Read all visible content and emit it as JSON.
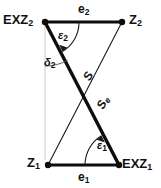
{
  "figure": {
    "type": "geometry-diagram",
    "background_color": "#ffffff",
    "stroke_color": "#111111"
  },
  "nodes": [
    {
      "id": "exz2",
      "label": "EXZ",
      "subscript": "2",
      "x": 45,
      "y": 22,
      "label_x": 3,
      "label_y": 13
    },
    {
      "id": "z2",
      "label": "Z",
      "subscript": "2",
      "x": 122,
      "y": 22,
      "label_x": 129,
      "label_y": 13
    },
    {
      "id": "z1",
      "label": "Z",
      "subscript": "1",
      "x": 48,
      "y": 165,
      "label_x": 27,
      "label_y": 156
    },
    {
      "id": "exz1",
      "label": "EXZ",
      "subscript": "1",
      "x": 119,
      "y": 165,
      "label_x": 122,
      "label_y": 157
    }
  ],
  "edges": [
    {
      "id": "e2",
      "label": "e",
      "subscript": "2",
      "from": "exz2",
      "to": "z2",
      "weight": "thick",
      "label_x": 78,
      "label_y": 3
    },
    {
      "id": "e1",
      "label": "e",
      "subscript": "1",
      "from": "z1",
      "to": "exz1",
      "weight": "thick",
      "label_x": 78,
      "label_y": 171
    },
    {
      "id": "s",
      "label": "S",
      "subscript": "",
      "from": "z1",
      "to": "z2",
      "weight": "thin",
      "label_x": 84,
      "label_y": 70
    },
    {
      "id": "se",
      "label": "S",
      "subscript": "e",
      "from": "exz2",
      "to": "exz1",
      "weight": "thick",
      "label_x": 97,
      "label_y": 96
    }
  ],
  "angles": [
    {
      "id": "eps2",
      "label": "ε",
      "subscript": "2",
      "at": "exz2",
      "label_x": 58,
      "label_y": 30
    },
    {
      "id": "delta2",
      "label": "δ",
      "subscript": "2",
      "at": "exz2",
      "label_x": 44,
      "label_y": 57
    },
    {
      "id": "eps1",
      "label": "ε",
      "subscript": "1",
      "at": "exz1",
      "label_x": 97,
      "label_y": 140
    }
  ],
  "reference_line": {
    "id": "vertical-reference",
    "from_x": 45,
    "from_y": 22,
    "to_x": 45,
    "to_y": 160,
    "style": "faint"
  }
}
